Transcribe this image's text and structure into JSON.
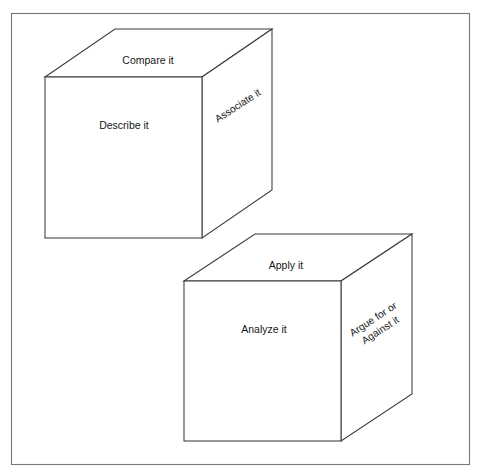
{
  "diagram": {
    "type": "cubing-strategy-diagram",
    "background_color": "#ffffff",
    "frame": {
      "name": "outer-border",
      "stroke_color": "#777777",
      "x": 11,
      "y": 13,
      "width": 459,
      "height": 452
    },
    "line_color": "#3b3b3b",
    "text_color": "#171717",
    "cubes": [
      {
        "id": "cube-1",
        "front_label": "Describe it",
        "top_label": "Compare it",
        "side_label": "Associate it",
        "side_label_lines": [
          "Associate it"
        ],
        "geometry": {
          "front": {
            "x": 45,
            "y": 77,
            "width": 157,
            "height": 161
          },
          "depth_dx": 70,
          "depth_dy": -48
        },
        "labels": {
          "top": {
            "x": 148,
            "y": 61,
            "rotation": 0
          },
          "front": {
            "x": 124,
            "y": 126,
            "rotation": 0
          },
          "side": {
            "x": 238,
            "y": 106,
            "rotation": -33
          }
        }
      },
      {
        "id": "cube-2",
        "front_label": "Analyze it",
        "top_label": "Apply it",
        "side_label": "Argue for or Against it",
        "side_label_lines": [
          "Argue for or",
          "Against it"
        ],
        "geometry": {
          "front": {
            "x": 184,
            "y": 281,
            "width": 157,
            "height": 160
          },
          "depth_dx": 71,
          "depth_dy": -47
        },
        "labels": {
          "top": {
            "x": 286,
            "y": 266,
            "rotation": 0
          },
          "front": {
            "x": 264,
            "y": 330,
            "rotation": 0
          },
          "side": {
            "x": 377,
            "y": 325,
            "rotation": -33
          }
        }
      }
    ]
  }
}
